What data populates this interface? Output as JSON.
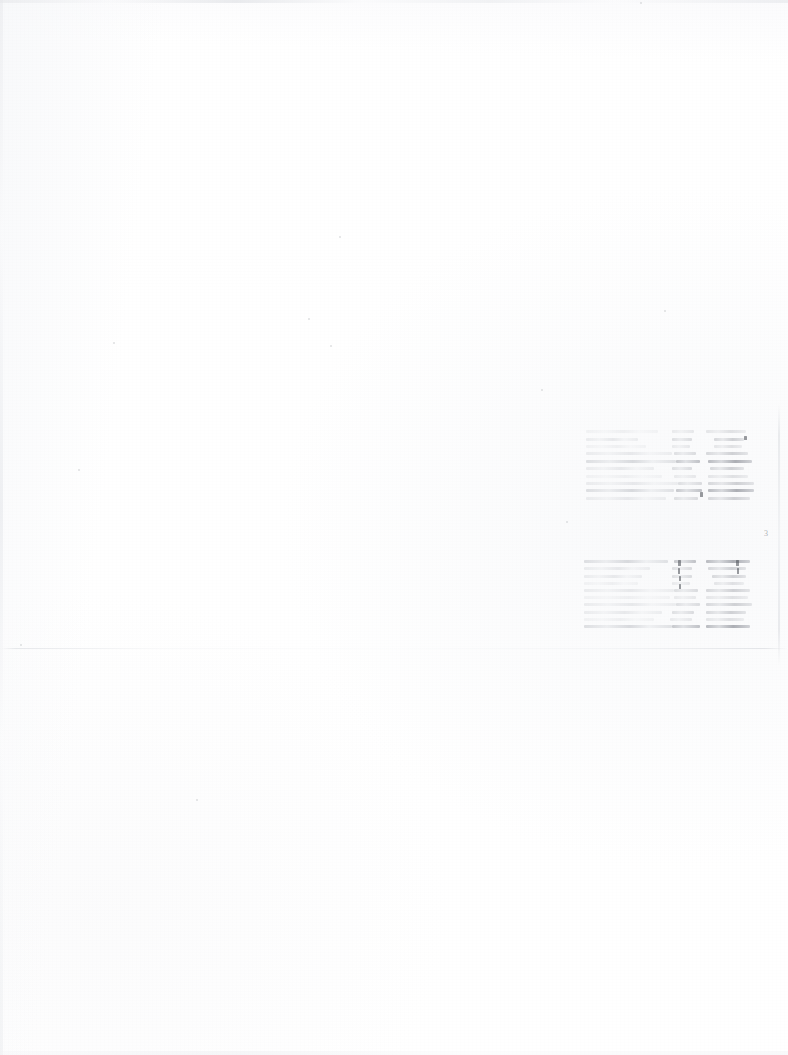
{
  "document": {
    "kind": "scanned-page",
    "condition": "faded",
    "page_width": 788,
    "page_height": 1055,
    "background_color": "#ffffff",
    "ink_color": "#8a8d95",
    "legibility_note": "illegible"
  },
  "marginalia": {
    "page_mark": "3",
    "page_mark_x": 764,
    "page_mark_y": 530
  },
  "rule": {
    "label": "horizontal-rule",
    "y": 648,
    "x": 0,
    "width": 788
  },
  "blocks": [
    {
      "id": "upper-table",
      "label": "upper-faded-table",
      "x": 586,
      "y": 428,
      "width": 170,
      "height": 74,
      "columns": [
        "label",
        "value-a",
        "value-b"
      ],
      "rows": [
        {
          "tone": "vfaint",
          "label_w": 72,
          "gap_a": 14,
          "mid_w": 22,
          "gap_b": 12,
          "val_w": 40
        },
        {
          "tone": "faint",
          "label_w": 52,
          "gap_a": 34,
          "mid_w": 20,
          "gap_b": 22,
          "val_w": 30
        },
        {
          "tone": "vfaint",
          "label_w": 60,
          "gap_a": 26,
          "mid_w": 18,
          "gap_b": 24,
          "val_w": 28
        },
        {
          "tone": "faint",
          "label_w": 86,
          "gap_a": 2,
          "mid_w": 22,
          "gap_b": 10,
          "val_w": 42
        },
        {
          "tone": "strong",
          "label_w": 90,
          "gap_a": 0,
          "mid_w": 24,
          "gap_b": 8,
          "val_w": 44
        },
        {
          "tone": "faint",
          "label_w": 68,
          "gap_a": 18,
          "mid_w": 20,
          "gap_b": 18,
          "val_w": 34
        },
        {
          "tone": "vfaint",
          "label_w": 76,
          "gap_a": 12,
          "mid_w": 22,
          "gap_b": 12,
          "val_w": 40
        },
        {
          "tone": "faint",
          "label_w": 92,
          "gap_a": 0,
          "mid_w": 24,
          "gap_b": 6,
          "val_w": 46
        },
        {
          "tone": "strong",
          "label_w": 88,
          "gap_a": 2,
          "mid_w": 26,
          "gap_b": 6,
          "val_w": 46
        },
        {
          "tone": "faint",
          "label_w": 80,
          "gap_a": 8,
          "mid_w": 24,
          "gap_b": 10,
          "val_w": 42
        }
      ]
    },
    {
      "id": "lower-table",
      "label": "lower-faded-table",
      "x": 584,
      "y": 558,
      "width": 172,
      "height": 72,
      "columns": [
        "label",
        "value-a",
        "value-b"
      ],
      "rows": [
        {
          "tone": "strong",
          "label_w": 84,
          "gap_a": 6,
          "mid_w": 22,
          "gap_b": 10,
          "val_w": 44
        },
        {
          "tone": "faint",
          "label_w": 66,
          "gap_a": 22,
          "mid_w": 20,
          "gap_b": 16,
          "val_w": 38
        },
        {
          "tone": "faint",
          "label_w": 58,
          "gap_a": 30,
          "mid_w": 20,
          "gap_b": 20,
          "val_w": 34
        },
        {
          "tone": "vfaint",
          "label_w": 54,
          "gap_a": 34,
          "mid_w": 18,
          "gap_b": 24,
          "val_w": 30
        },
        {
          "tone": "faint",
          "label_w": 90,
          "gap_a": 0,
          "mid_w": 24,
          "gap_b": 8,
          "val_w": 44
        },
        {
          "tone": "vfaint",
          "label_w": 86,
          "gap_a": 4,
          "mid_w": 22,
          "gap_b": 10,
          "val_w": 42
        },
        {
          "tone": "faint",
          "label_w": 92,
          "gap_a": 0,
          "mid_w": 24,
          "gap_b": 6,
          "val_w": 46
        },
        {
          "tone": "faint",
          "label_w": 78,
          "gap_a": 10,
          "mid_w": 22,
          "gap_b": 12,
          "val_w": 40
        },
        {
          "tone": "vfaint",
          "label_w": 70,
          "gap_a": 16,
          "mid_w": 22,
          "gap_b": 14,
          "val_w": 38
        },
        {
          "tone": "strong",
          "label_w": 88,
          "gap_a": 0,
          "mid_w": 28,
          "gap_b": 6,
          "val_w": 44
        }
      ]
    }
  ],
  "flecks": [
    {
      "x": 678,
      "y": 560,
      "w": 3,
      "h": 6
    },
    {
      "x": 678,
      "y": 568,
      "w": 2,
      "h": 6
    },
    {
      "x": 679,
      "y": 576,
      "w": 2,
      "h": 5
    },
    {
      "x": 679,
      "y": 584,
      "w": 2,
      "h": 5
    },
    {
      "x": 736,
      "y": 560,
      "w": 3,
      "h": 6
    },
    {
      "x": 737,
      "y": 568,
      "w": 2,
      "h": 6
    },
    {
      "x": 700,
      "y": 492,
      "w": 3,
      "h": 5
    },
    {
      "x": 744,
      "y": 436,
      "w": 3,
      "h": 4
    }
  ],
  "specks": [
    {
      "x": 308,
      "y": 318,
      "d": 2
    },
    {
      "x": 330,
      "y": 345,
      "d": 2
    },
    {
      "x": 541,
      "y": 389,
      "d": 2
    },
    {
      "x": 566,
      "y": 521,
      "d": 2
    },
    {
      "x": 196,
      "y": 799,
      "d": 2
    },
    {
      "x": 113,
      "y": 342,
      "d": 2
    },
    {
      "x": 640,
      "y": 2,
      "d": 2
    },
    {
      "x": 339,
      "y": 236,
      "d": 2
    },
    {
      "x": 78,
      "y": 469,
      "d": 2
    },
    {
      "x": 664,
      "y": 310,
      "d": 2
    },
    {
      "x": 20,
      "y": 644,
      "d": 2
    }
  ]
}
